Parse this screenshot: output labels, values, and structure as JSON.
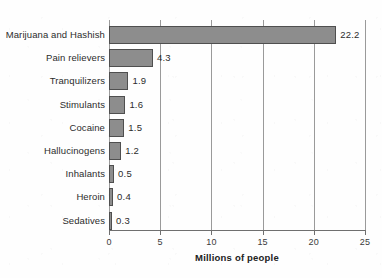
{
  "chart_data": {
    "type": "bar",
    "orientation": "horizontal",
    "title": "",
    "xlabel": "Millions of people",
    "ylabel": "",
    "xlim": [
      0,
      25
    ],
    "xticks": [
      0,
      5,
      10,
      15,
      20,
      25
    ],
    "xtick_labels": [
      "0",
      "5",
      "10",
      "15",
      "20",
      "25"
    ],
    "grid": true,
    "grid_axis": "x",
    "legend": false,
    "bar_color": "#8d8d8d",
    "bar_border_color": "#4f4f4f",
    "categories": [
      "Marijuana and Hashish",
      "Pain relievers",
      "Tranquilizers",
      "Stimulants",
      "Cocaine",
      "Hallucinogens",
      "Inhalants",
      "Heroin",
      "Sedatives"
    ],
    "values": [
      22.2,
      4.3,
      1.9,
      1.6,
      1.5,
      1.2,
      0.5,
      0.4,
      0.3
    ],
    "value_labels": [
      "22.2",
      "4.3",
      "1.9",
      "1.6",
      "1.5",
      "1.2",
      "0.5",
      "0.4",
      "0.3"
    ]
  }
}
